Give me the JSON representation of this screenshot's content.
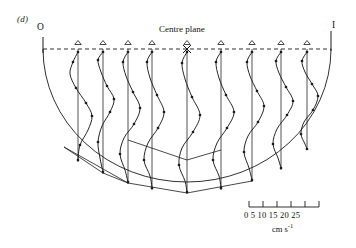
{
  "figure": {
    "panel_label": "(d)",
    "origin_label": "O",
    "right_label": "I",
    "centre_label": "Centre plane",
    "units_label": "cm s",
    "units_exponent": "-1",
    "scale_tick_text": "0  5 10 15 20 25",
    "line_color": "#1a1a1a",
    "background": "#ffffff"
  },
  "chart_data": {
    "type": "line",
    "title": "(d)",
    "xlabel": "",
    "ylabel": "",
    "annotations": [
      "O",
      "Centre plane",
      "I"
    ],
    "scale_bar": {
      "ticks": [
        0,
        5,
        10,
        15,
        20,
        25
      ],
      "units": "cm s^-1",
      "x_px_start": 249,
      "x_px_end": 319
    },
    "geometry": {
      "shape": "semicircular-cross-section",
      "surface_y": 49,
      "left_x": 43,
      "right_x": 331,
      "centre_x": 187,
      "radius_x": 144,
      "radius_y": 133
    },
    "station_markers": "open-triangle",
    "centre_marker": "cross",
    "stations": [
      {
        "x": 78,
        "base_y_bottom": 162,
        "triangle_x": 78,
        "profile": [
          [
            78,
            52
          ],
          [
            73,
            62
          ],
          [
            70,
            74
          ],
          [
            76,
            88
          ],
          [
            86,
            103
          ],
          [
            92,
            116
          ],
          [
            88,
            130
          ],
          [
            80,
            145
          ],
          [
            78,
            160
          ]
        ],
        "points": [
          [
            78,
            52
          ],
          [
            73,
            62
          ],
          [
            76,
            88
          ],
          [
            86,
            103
          ],
          [
            92,
            116
          ],
          [
            80,
            145
          ],
          [
            78,
            160
          ]
        ]
      },
      {
        "x": 103,
        "base_y_bottom": 174,
        "triangle_x": 103,
        "profile": [
          [
            103,
            52
          ],
          [
            98,
            60
          ],
          [
            101,
            72
          ],
          [
            107,
            86
          ],
          [
            114,
            99
          ],
          [
            110,
            112
          ],
          [
            102,
            126
          ],
          [
            98,
            142
          ],
          [
            100,
            158
          ],
          [
            103,
            172
          ]
        ],
        "points": [
          [
            103,
            52
          ],
          [
            98,
            60
          ],
          [
            107,
            86
          ],
          [
            114,
            99
          ],
          [
            110,
            112
          ],
          [
            98,
            142
          ],
          [
            103,
            172
          ]
        ]
      },
      {
        "x": 128,
        "base_y_bottom": 184,
        "triangle_x": 128,
        "profile": [
          [
            128,
            52
          ],
          [
            123,
            62
          ],
          [
            126,
            76
          ],
          [
            133,
            92
          ],
          [
            140,
            108
          ],
          [
            134,
            124
          ],
          [
            124,
            138
          ],
          [
            120,
            154
          ],
          [
            125,
            170
          ],
          [
            128,
            182
          ]
        ],
        "points": [
          [
            128,
            52
          ],
          [
            123,
            62
          ],
          [
            133,
            92
          ],
          [
            140,
            108
          ],
          [
            134,
            124
          ],
          [
            120,
            154
          ],
          [
            128,
            182
          ]
        ]
      },
      {
        "x": 152,
        "base_y_bottom": 190,
        "triangle_x": 152,
        "profile": [
          [
            152,
            52
          ],
          [
            147,
            62
          ],
          [
            150,
            78
          ],
          [
            157,
            95
          ],
          [
            164,
            112
          ],
          [
            158,
            128
          ],
          [
            148,
            143
          ],
          [
            144,
            160
          ],
          [
            150,
            176
          ],
          [
            152,
            188
          ]
        ],
        "points": [
          [
            152,
            52
          ],
          [
            147,
            62
          ],
          [
            157,
            95
          ],
          [
            164,
            112
          ],
          [
            158,
            128
          ],
          [
            144,
            160
          ],
          [
            152,
            188
          ]
        ]
      },
      {
        "x": 187,
        "base_y_bottom": 194,
        "triangle_x": 187,
        "profile": [
          [
            187,
            52
          ],
          [
            182,
            63
          ],
          [
            185,
            79
          ],
          [
            192,
            97
          ],
          [
            200,
            115
          ],
          [
            193,
            132
          ],
          [
            182,
            148
          ],
          [
            179,
            165
          ],
          [
            185,
            181
          ],
          [
            187,
            192
          ]
        ],
        "points": [
          [
            187,
            52
          ],
          [
            182,
            63
          ],
          [
            192,
            97
          ],
          [
            200,
            115
          ],
          [
            193,
            132
          ],
          [
            179,
            165
          ],
          [
            187,
            192
          ]
        ]
      },
      {
        "x": 221,
        "base_y_bottom": 190,
        "triangle_x": 221,
        "profile": [
          [
            221,
            52
          ],
          [
            216,
            62
          ],
          [
            219,
            78
          ],
          [
            226,
            95
          ],
          [
            234,
            112
          ],
          [
            227,
            128
          ],
          [
            217,
            143
          ],
          [
            213,
            160
          ],
          [
            219,
            176
          ],
          [
            221,
            188
          ]
        ],
        "points": [
          [
            221,
            52
          ],
          [
            216,
            62
          ],
          [
            226,
            95
          ],
          [
            234,
            112
          ],
          [
            227,
            128
          ],
          [
            213,
            160
          ],
          [
            221,
            188
          ]
        ]
      },
      {
        "x": 252,
        "base_y_bottom": 182,
        "triangle_x": 252,
        "profile": [
          [
            252,
            52
          ],
          [
            247,
            62
          ],
          [
            250,
            76
          ],
          [
            257,
            91
          ],
          [
            264,
            106
          ],
          [
            258,
            122
          ],
          [
            248,
            136
          ],
          [
            244,
            152
          ],
          [
            249,
            168
          ],
          [
            252,
            180
          ]
        ],
        "points": [
          [
            252,
            52
          ],
          [
            247,
            62
          ],
          [
            257,
            91
          ],
          [
            264,
            106
          ],
          [
            258,
            122
          ],
          [
            244,
            152
          ],
          [
            252,
            180
          ]
        ]
      },
      {
        "x": 281,
        "base_y_bottom": 170,
        "triangle_x": 281,
        "profile": [
          [
            281,
            52
          ],
          [
            276,
            61
          ],
          [
            279,
            73
          ],
          [
            286,
            87
          ],
          [
            293,
            101
          ],
          [
            287,
            115
          ],
          [
            277,
            129
          ],
          [
            273,
            144
          ],
          [
            278,
            158
          ],
          [
            281,
            168
          ]
        ],
        "points": [
          [
            281,
            52
          ],
          [
            276,
            61
          ],
          [
            286,
            87
          ],
          [
            293,
            101
          ],
          [
            287,
            115
          ],
          [
            273,
            144
          ],
          [
            281,
            168
          ]
        ]
      },
      {
        "x": 307,
        "base_y_bottom": 150,
        "triangle_x": 307,
        "profile": [
          [
            307,
            52
          ],
          [
            302,
            61
          ],
          [
            305,
            72
          ],
          [
            312,
            84
          ],
          [
            318,
            96
          ],
          [
            313,
            110
          ],
          [
            304,
            122
          ],
          [
            301,
            134
          ],
          [
            305,
            144
          ],
          [
            307,
            149
          ]
        ],
        "points": [
          [
            307,
            52
          ],
          [
            302,
            61
          ],
          [
            312,
            84
          ],
          [
            318,
            96
          ],
          [
            313,
            110
          ],
          [
            301,
            134
          ],
          [
            307,
            149
          ]
        ]
      }
    ],
    "inner_chords": [
      [
        [
          64,
          147
        ],
        [
          128,
          183
        ]
      ],
      [
        [
          128,
          183
        ],
        [
          187,
          193
        ]
      ],
      [
        [
          187,
          193
        ],
        [
          252,
          181
        ]
      ],
      [
        [
          64,
          147
        ],
        [
          103,
          173
        ]
      ],
      [
        [
          103,
          173
        ],
        [
          128,
          183
        ]
      ],
      [
        [
          128,
          140
        ],
        [
          187,
          160
        ]
      ],
      [
        [
          187,
          160
        ],
        [
          221,
          150
        ]
      ]
    ]
  }
}
